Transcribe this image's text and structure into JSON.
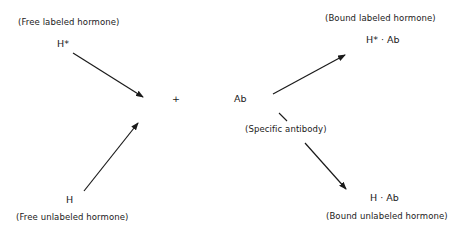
{
  "diagram": {
    "type": "reaction-scheme",
    "left": {
      "top": {
        "symbol": "H*",
        "caption": "(Free labeled hormone)"
      },
      "bottom": {
        "symbol": "H",
        "caption": "(Free unlabeled hormone)"
      }
    },
    "center": {
      "operator": "+",
      "reagent": "Ab",
      "reagent_caption": "(Specific antibody)"
    },
    "right": {
      "top": {
        "symbol": "H* · Ab",
        "caption": "(Bound labeled hormone)"
      },
      "bottom": {
        "symbol": "H · Ab",
        "caption": "(Bound unlabeled hormone)"
      }
    },
    "edges": [
      {
        "from": "H*",
        "to": "+"
      },
      {
        "from": "H",
        "to": "+"
      },
      {
        "from": "Ab",
        "to": "H* · Ab"
      },
      {
        "from": "Ab",
        "to": "H · Ab"
      }
    ],
    "line_color": "#1a1a1a"
  }
}
